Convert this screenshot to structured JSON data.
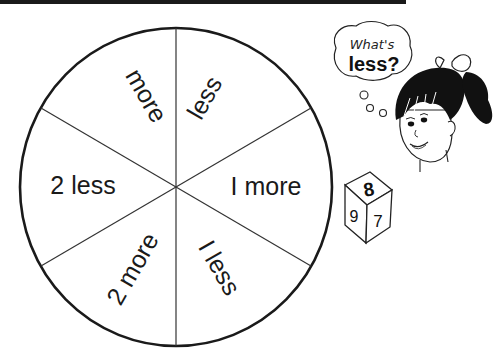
{
  "spinner": {
    "sectors": [
      {
        "label": "less"
      },
      {
        "label": "I more"
      },
      {
        "label": "I less"
      },
      {
        "label": "2 more"
      },
      {
        "label": "2 less"
      },
      {
        "label": "more"
      }
    ]
  },
  "thought_bubble": {
    "line1": "What's",
    "line2": "less?"
  },
  "die": {
    "top": "8",
    "left": "9",
    "right": "7"
  },
  "colors": {
    "ink": "#1a1a1a",
    "paper": "#ffffff"
  }
}
